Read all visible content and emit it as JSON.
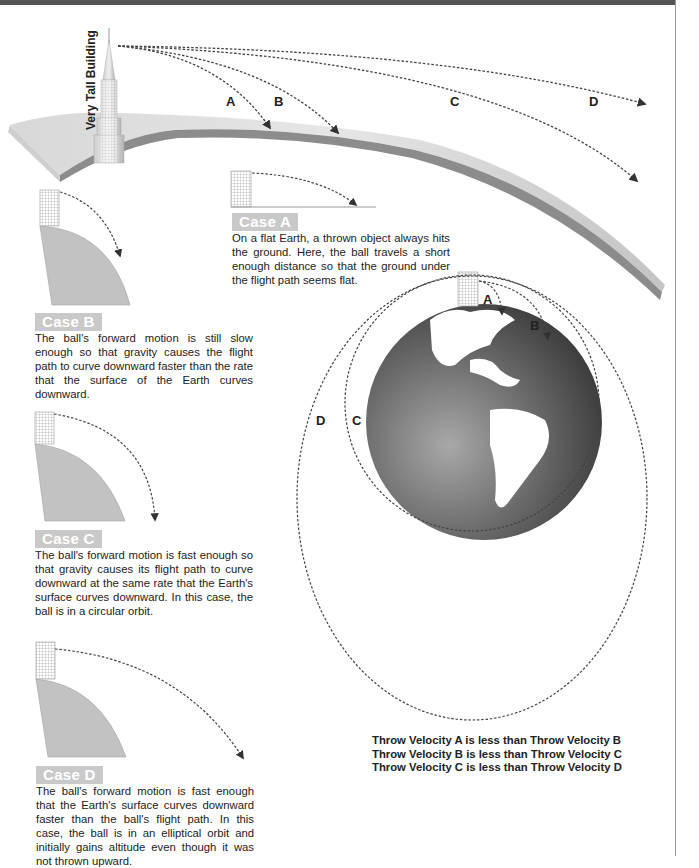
{
  "header": {
    "bar_color": "#555555"
  },
  "building": {
    "label": "Very Tall Building"
  },
  "trajectory_labels": {
    "top": [
      "A",
      "B",
      "C",
      "D"
    ],
    "globe": [
      "A",
      "B",
      "C",
      "D"
    ]
  },
  "cases": [
    {
      "id": "A",
      "label": "Case A",
      "text": "On a flat Earth, a thrown object always hits the ground. Here, the ball travels a short enough distance so that the ground under the flight path seems flat."
    },
    {
      "id": "B",
      "label": "Case B",
      "text": "The ball's forward motion is still slow enough so that gravity causes the flight path to curve downward faster than the rate that the surface of the Earth curves downward."
    },
    {
      "id": "C",
      "label": "Case C",
      "text": "The ball's forward motion is fast enough so that gravity causes its flight path to curve downward at the same rate that the Earth's surface curves downward. In this case, the ball is in a circular orbit."
    },
    {
      "id": "D",
      "label": "Case D",
      "text": "The ball's forward motion is fast enough that the Earth's surface curves downward faster than the ball's flight path. In this case, the ball is in an elliptical orbit and initially gains altitude even though it was not thrown upward."
    }
  ],
  "summary": [
    "Throw Velocity A is less than Throw Velocity B",
    "Throw Velocity B is less than Throw Velocity C",
    "Throw Velocity C is less than Throw Velocity D"
  ],
  "colors": {
    "label_bg": "#c9c9c9",
    "ground": "#b8b8b8",
    "globe_ocean": "#5a5a5a",
    "land": "#ffffff"
  }
}
